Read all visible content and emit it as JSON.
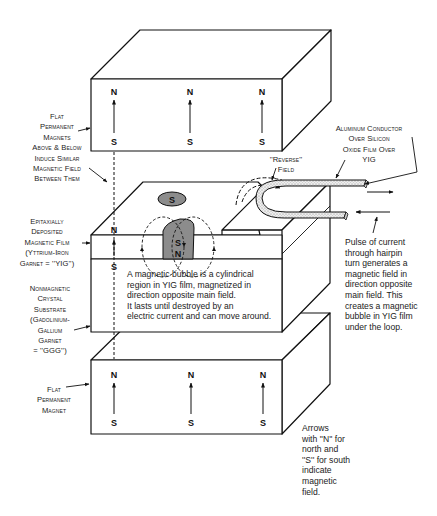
{
  "figure": {
    "type": "magnetic bubble memory diagram",
    "poles": {
      "north": "N",
      "south": "S"
    }
  },
  "labels": {
    "top_magnets": [
      "Flat",
      "Permanent",
      "Magnets",
      "Above & Below",
      "Induce Similar",
      "Magnetic Field",
      "Between Them"
    ],
    "yig_film": [
      "Epitaxially",
      "Deposited",
      "Magnetic Film",
      "(Yttrium-Iron",
      "Garnet = ''YIG'')"
    ],
    "substrate": [
      "Nonmagnetic",
      "Crystal",
      "Substrate",
      "(Gadolinium-",
      "Gallium",
      "Garnet",
      "= ''GGG'')"
    ],
    "bottom_magnet": [
      "Flat",
      "Permanent",
      "Magnet"
    ],
    "conductor": [
      "Aluminum Conductor",
      "Over Silicon",
      "Oxide Film Over",
      "YIG"
    ],
    "reverse_field": [
      "''Reverse''",
      "Field"
    ]
  },
  "notes": {
    "bubble": [
      "A magnetic bubble  is a cylindrical",
      "region in YIG film, magnetized in",
      "direction opposite main field.",
      "It lasts until destroyed by an",
      "electric current and can move around."
    ],
    "pulse": [
      "Pulse of current",
      "through hairpin",
      "turn generates a",
      "magnetic field in",
      "direction opposite",
      "main field. This",
      "creates a magnetic",
      "bubble in YIG film",
      "under the loop."
    ],
    "arrows": [
      "Arrows",
      "with ''N'' for",
      "north and",
      "''S'' for south",
      "indicate",
      "magnetic",
      "field."
    ]
  }
}
